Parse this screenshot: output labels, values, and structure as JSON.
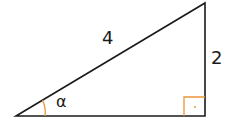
{
  "diagram": {
    "type": "right-triangle",
    "labels": {
      "hypotenuse": "4",
      "opposite": "2",
      "angle": "α"
    },
    "colors": {
      "lines": "#1a1a1a",
      "angle_marks": "#e8953a"
    },
    "vertices": {
      "bottom_left": [
        16,
        116
      ],
      "bottom_right": [
        205,
        116
      ],
      "top": [
        205,
        3
      ]
    }
  }
}
